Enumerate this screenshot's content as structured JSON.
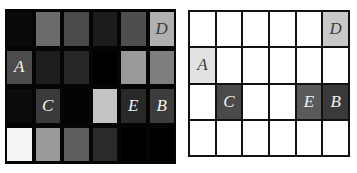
{
  "figure": {
    "left_grid": {
      "rows": 4,
      "cols": 6,
      "cells": [
        [
          {
            "c": "#0a0a0a",
            "t": ""
          },
          {
            "c": "#6a6a6a",
            "t": ""
          },
          {
            "c": "#4a4a4a",
            "t": ""
          },
          {
            "c": "#1c1c1c",
            "t": ""
          },
          {
            "c": "#4e4e4e",
            "t": ""
          },
          {
            "c": "#b0b0b0",
            "t": "D",
            "dark": true
          }
        ],
        [
          {
            "c": "#4c4c4c",
            "t": "A"
          },
          {
            "c": "#1e1e1e",
            "t": ""
          },
          {
            "c": "#262626",
            "t": ""
          },
          {
            "c": "#000000",
            "t": ""
          },
          {
            "c": "#9a9a9a",
            "t": ""
          },
          {
            "c": "#7e7e7e",
            "t": ""
          }
        ],
        [
          {
            "c": "#0c0c0c",
            "t": ""
          },
          {
            "c": "#3a3a3a",
            "t": "C"
          },
          {
            "c": "#020202",
            "t": ""
          },
          {
            "c": "#c4c4c4",
            "t": ""
          },
          {
            "c": "#282828",
            "t": "E"
          },
          {
            "c": "#3c3c3c",
            "t": "B"
          }
        ],
        [
          {
            "c": "#f4f4f4",
            "t": ""
          },
          {
            "c": "#9a9a9a",
            "t": ""
          },
          {
            "c": "#5e5e5e",
            "t": ""
          },
          {
            "c": "#2a2a2a",
            "t": ""
          },
          {
            "c": "#000000",
            "t": ""
          },
          {
            "c": "#000000",
            "t": ""
          }
        ]
      ]
    },
    "right_grid": {
      "rows": 4,
      "cols": 6,
      "cells": [
        [
          {
            "c": "#ffffff",
            "t": ""
          },
          {
            "c": "#ffffff",
            "t": ""
          },
          {
            "c": "#ffffff",
            "t": ""
          },
          {
            "c": "#ffffff",
            "t": ""
          },
          {
            "c": "#ffffff",
            "t": ""
          },
          {
            "c": "#c8c8c8",
            "t": "D",
            "dark": true
          }
        ],
        [
          {
            "c": "#e2e2e2",
            "t": "A",
            "dark": true
          },
          {
            "c": "#ffffff",
            "t": ""
          },
          {
            "c": "#ffffff",
            "t": ""
          },
          {
            "c": "#ffffff",
            "t": ""
          },
          {
            "c": "#ffffff",
            "t": ""
          },
          {
            "c": "#ffffff",
            "t": ""
          }
        ],
        [
          {
            "c": "#ffffff",
            "t": ""
          },
          {
            "c": "#4a4a4a",
            "t": "C"
          },
          {
            "c": "#ffffff",
            "t": ""
          },
          {
            "c": "#ffffff",
            "t": ""
          },
          {
            "c": "#5a5a5a",
            "t": "E"
          },
          {
            "c": "#3a3a3a",
            "t": "B"
          }
        ],
        [
          {
            "c": "#ffffff",
            "t": ""
          },
          {
            "c": "#ffffff",
            "t": ""
          },
          {
            "c": "#ffffff",
            "t": ""
          },
          {
            "c": "#ffffff",
            "t": ""
          },
          {
            "c": "#ffffff",
            "t": ""
          },
          {
            "c": "#ffffff",
            "t": ""
          }
        ]
      ]
    },
    "labels": [
      "A",
      "B",
      "C",
      "D",
      "E"
    ]
  }
}
